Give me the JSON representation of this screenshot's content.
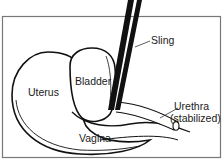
{
  "diagram": {
    "labels": {
      "sling": "Sling",
      "uterus": "Uterus",
      "bladder": "Bladder",
      "vagina": "Vagina",
      "urethra": "Urethra",
      "urethra_note": "(stabilized)"
    },
    "colors": {
      "stroke": "#111111",
      "frame": "#777777",
      "background": "#ffffff"
    }
  }
}
